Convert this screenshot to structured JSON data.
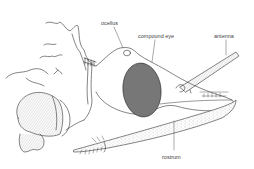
{
  "diagram": {
    "labels": {
      "ocellus": "ocellus",
      "compound_eye": "compound eye",
      "antenna": "antenna",
      "rostrum": "rostrum"
    },
    "colors": {
      "line": "#333333",
      "label": "#444444",
      "eye_fill": "#7a7a7a",
      "background": "#ffffff"
    }
  }
}
